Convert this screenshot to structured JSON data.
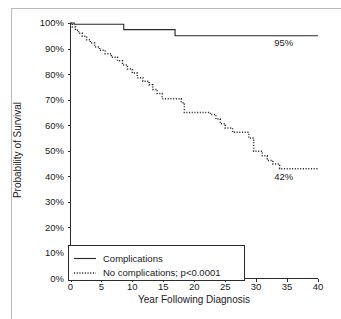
{
  "chart_data": {
    "type": "line",
    "title": "",
    "subtitle": "",
    "xlabel": "Year Following Diagnosis",
    "ylabel": "Probability of Survival",
    "xlim": [
      0,
      40
    ],
    "ylim": [
      0,
      100
    ],
    "xticks": [
      0,
      5,
      10,
      15,
      20,
      25,
      30,
      35,
      40
    ],
    "xtick_labels": [
      "0",
      "5",
      "10",
      "15",
      "20",
      "25",
      "30",
      "35",
      "40"
    ],
    "yticks": [
      0,
      10,
      20,
      30,
      40,
      50,
      60,
      70,
      80,
      90,
      100
    ],
    "ytick_labels": [
      "0%",
      "10%",
      "20%",
      "30%",
      "40%",
      "50%",
      "60%",
      "70%",
      "80%",
      "90%",
      "100%"
    ],
    "grid": false,
    "legend_position": "bottom-left",
    "step_type": "post",
    "series": [
      {
        "name": "Complications",
        "style": "solid",
        "color": "#2b2b2b",
        "end_label": "95%",
        "points": [
          [
            0,
            100
          ],
          [
            0.6,
            100
          ],
          [
            0.6,
            99.5
          ],
          [
            8.6,
            99.5
          ],
          [
            8.6,
            97.4
          ],
          [
            16.9,
            97.4
          ],
          [
            16.9,
            95.0
          ],
          [
            40,
            95.0
          ]
        ]
      },
      {
        "name": "No complications; p<0.0001",
        "style": "dotted",
        "color": "#2b2b2b",
        "end_label": "42%",
        "points": [
          [
            0,
            100
          ],
          [
            0.3,
            100
          ],
          [
            0.3,
            98.4
          ],
          [
            0.8,
            98.4
          ],
          [
            0.8,
            97.2
          ],
          [
            1.3,
            97.2
          ],
          [
            1.3,
            96.0
          ],
          [
            1.9,
            96.0
          ],
          [
            1.9,
            94.8
          ],
          [
            2.6,
            94.8
          ],
          [
            2.6,
            93.4
          ],
          [
            3.2,
            93.4
          ],
          [
            3.2,
            92.2
          ],
          [
            3.9,
            92.2
          ],
          [
            3.9,
            90.6
          ],
          [
            4.7,
            90.6
          ],
          [
            4.7,
            89.3
          ],
          [
            5.6,
            89.3
          ],
          [
            5.6,
            88.0
          ],
          [
            6.6,
            88.0
          ],
          [
            6.6,
            86.6
          ],
          [
            7.6,
            86.6
          ],
          [
            7.6,
            85.2
          ],
          [
            8.4,
            85.2
          ],
          [
            8.4,
            83.6
          ],
          [
            9.2,
            83.6
          ],
          [
            9.2,
            82.0
          ],
          [
            10.0,
            82.0
          ],
          [
            10.0,
            80.4
          ],
          [
            10.8,
            80.4
          ],
          [
            10.8,
            78.6
          ],
          [
            11.7,
            78.6
          ],
          [
            11.7,
            77.2
          ],
          [
            12.7,
            77.2
          ],
          [
            12.7,
            75.8
          ],
          [
            13.3,
            75.8
          ],
          [
            13.3,
            74.0
          ],
          [
            14.0,
            74.0
          ],
          [
            14.0,
            72.4
          ],
          [
            14.8,
            72.4
          ],
          [
            14.8,
            70.4
          ],
          [
            17.9,
            70.4
          ],
          [
            17.9,
            68.8
          ],
          [
            18.4,
            68.8
          ],
          [
            18.4,
            65.0
          ],
          [
            22.6,
            65.0
          ],
          [
            22.6,
            64.2
          ],
          [
            23.5,
            64.2
          ],
          [
            23.5,
            62.4
          ],
          [
            24.2,
            62.4
          ],
          [
            24.2,
            60.6
          ],
          [
            25.0,
            60.6
          ],
          [
            25.0,
            58.9
          ],
          [
            26.2,
            58.9
          ],
          [
            26.2,
            57.2
          ],
          [
            28.8,
            57.2
          ],
          [
            28.8,
            55.0
          ],
          [
            29.6,
            55.0
          ],
          [
            29.6,
            49.8
          ],
          [
            31.0,
            49.8
          ],
          [
            31.0,
            48.0
          ],
          [
            31.8,
            48.0
          ],
          [
            31.8,
            46.2
          ],
          [
            32.7,
            46.2
          ],
          [
            32.7,
            44.8
          ],
          [
            33.8,
            44.8
          ],
          [
            33.8,
            43.0
          ],
          [
            40,
            43.0
          ]
        ]
      }
    ],
    "annotations": [
      {
        "text": "95%",
        "x": 36.0,
        "y": 91.0,
        "anchor": "end"
      },
      {
        "text": "42%",
        "x": 36.0,
        "y": 38.5,
        "anchor": "end"
      }
    ],
    "legend": {
      "entries": [
        {
          "label": "Complications",
          "style": "solid"
        },
        {
          "label": "No complications; p<0.0001",
          "style": "dotted"
        }
      ]
    }
  }
}
